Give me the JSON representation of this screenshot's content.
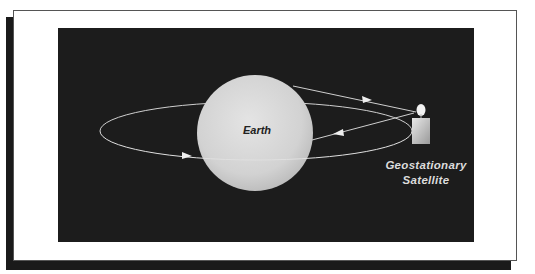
{
  "diagram": {
    "title": "",
    "labels": {
      "earth": "Earth",
      "satellite_line1": "Geostationary",
      "satellite_line2": "Satellite"
    },
    "elements": {
      "earth": {
        "shape": "circle",
        "cx": 255,
        "cy": 133,
        "r": 58
      },
      "orbit": {
        "shape": "ellipse",
        "cx": 256,
        "cy": 131,
        "rx": 156,
        "ry": 29
      },
      "satellite": {
        "dish_cx": 420,
        "dish_cy": 110,
        "body_x": 412,
        "body_y": 118,
        "body_w": 17,
        "body_h": 26
      },
      "uplink": {
        "from": "earth",
        "to": "satellite",
        "direction": "right"
      },
      "downlink": {
        "from": "satellite",
        "to": "earth",
        "direction": "left"
      }
    },
    "colors": {
      "background_panel": "#1c1c1c",
      "earth_fill": "#d8d8d8",
      "line": "#cfcfcf",
      "frame_shadow": "#1a1a1a"
    }
  }
}
